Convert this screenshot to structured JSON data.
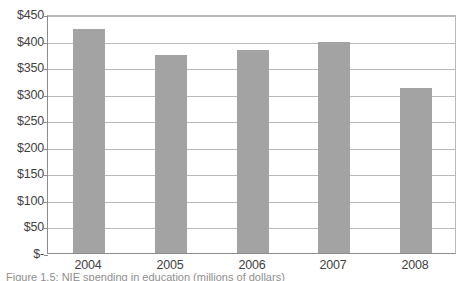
{
  "figure": {
    "caption": "Figure 1.5: NIE spending in education (millions of dollars)"
  },
  "chart_data": {
    "type": "bar",
    "title": "",
    "subtitle": "",
    "xlabel": "",
    "ylabel": "",
    "categories": [
      "2004",
      "2005",
      "2006",
      "2007",
      "2008"
    ],
    "values": [
      422,
      373,
      383,
      398,
      310
    ],
    "series": [
      {
        "name": "Spending",
        "values": [
          422,
          373,
          383,
          398,
          310
        ]
      }
    ],
    "ylim": [
      0,
      450
    ],
    "ytick_values": [
      450,
      400,
      350,
      300,
      250,
      200,
      150,
      100,
      50,
      0
    ],
    "ytick_labels": [
      "$450",
      "$400",
      "$350",
      "$300",
      "$250",
      "$200",
      "$150",
      "$100",
      "$50",
      "$-"
    ],
    "grid": true,
    "legend": false,
    "legend_position": "none",
    "bar_color": "#a3a3a3",
    "gridline_color": "#b9b9b9",
    "axis_color": "#8d8d8d",
    "background_color": "#ffffff"
  }
}
